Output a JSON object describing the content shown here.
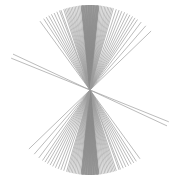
{
  "figure": {
    "label": "starburst line pattern",
    "center": [
      90,
      90
    ],
    "radius": 85,
    "stroke_color": "#9a9a9a",
    "dense_stroke_color": "#8c8c8c",
    "background": "#ffffff"
  },
  "lines_deg": [
    -36,
    -33,
    -31,
    -29,
    -27,
    -25,
    -23,
    -21,
    -20,
    -18,
    -17,
    -16,
    -15,
    -14,
    -13,
    -12,
    -11,
    -10,
    -9,
    -8,
    -7,
    -6,
    -5.5,
    -5,
    -4.5,
    -4,
    -3.5,
    -3,
    -2.5,
    -2,
    -1.5,
    -1,
    -0.5,
    0,
    0.5,
    1,
    1.5,
    2,
    2.5,
    3,
    3.5,
    4,
    4.5,
    5,
    5.5,
    6,
    7,
    8,
    9,
    10,
    11,
    12,
    13,
    14,
    15,
    16,
    18,
    20,
    22,
    24,
    26,
    28,
    30,
    32,
    34,
    37,
    41,
    46,
    -68,
    -65
  ]
}
